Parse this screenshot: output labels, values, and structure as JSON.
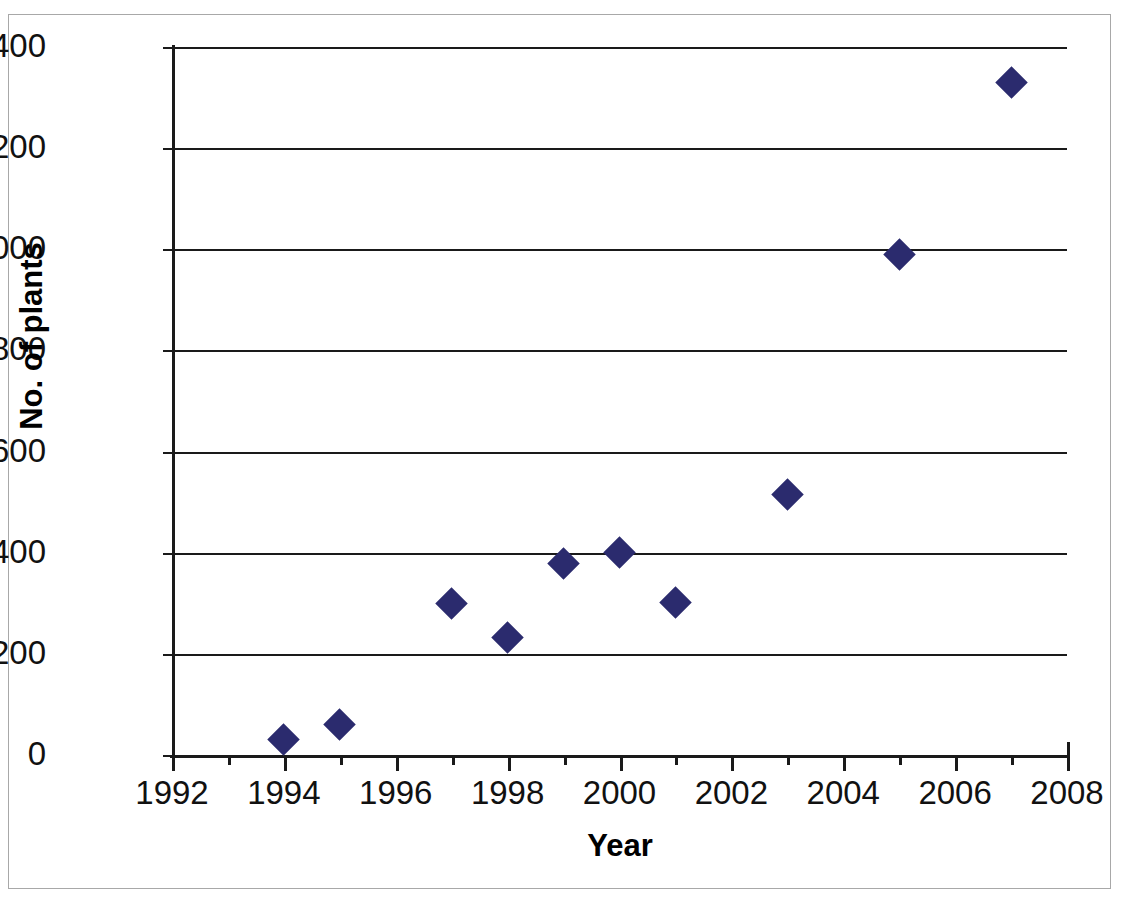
{
  "chart_data": {
    "type": "scatter",
    "title": "",
    "xlabel": "Year",
    "ylabel": "No. of plants",
    "xlim": [
      1992,
      2008
    ],
    "ylim": [
      0,
      1400
    ],
    "grid": "horizontal",
    "legend": "none",
    "marker": {
      "shape": "diamond",
      "color": "#2b2b6e",
      "size": 23
    },
    "xticks": [
      1992,
      1994,
      1996,
      1998,
      2000,
      2002,
      2004,
      2006,
      2008
    ],
    "xtick_labels": [
      "1992",
      "1994",
      "1996",
      "1998",
      "2000",
      "2002",
      "2004",
      "2006",
      "2008"
    ],
    "xminor_ticks": [
      1993,
      1995,
      1997,
      1999,
      2001,
      2003,
      2005,
      2007
    ],
    "yticks": [
      0,
      200,
      400,
      600,
      800,
      1000,
      1200,
      1400
    ],
    "ytick_labels": [
      "0",
      "200",
      "400",
      "600",
      "800",
      "1000",
      "1200",
      "1400"
    ],
    "x": [
      1994,
      1995,
      1997,
      1998,
      1999,
      2000,
      2001,
      2003,
      2005,
      2007
    ],
    "y": [
      30,
      60,
      300,
      232,
      378,
      400,
      302,
      515,
      990,
      1330
    ],
    "points": [
      {
        "x": 1994,
        "y": 30
      },
      {
        "x": 1995,
        "y": 60
      },
      {
        "x": 1997,
        "y": 300
      },
      {
        "x": 1998,
        "y": 232
      },
      {
        "x": 1999,
        "y": 378
      },
      {
        "x": 2000,
        "y": 400
      },
      {
        "x": 2001,
        "y": 302
      },
      {
        "x": 2003,
        "y": 515
      },
      {
        "x": 2005,
        "y": 990
      },
      {
        "x": 2007,
        "y": 1330
      }
    ]
  },
  "colors": {
    "marker": "#2b2b6e",
    "axis": "#1a1a1a",
    "frame": "#a8a8a8",
    "background": "#ffffff"
  }
}
